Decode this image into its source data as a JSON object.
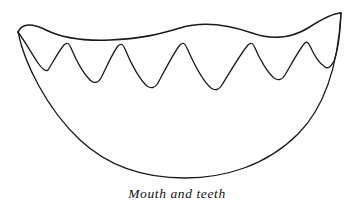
{
  "figure": {
    "title": "Mouth and teeth",
    "caption": "Mouth and teeth",
    "style": "black-and-white line art",
    "background_color": "#ffffff",
    "stroke_color": "#1a1a1a",
    "stroke_width": 1.3,
    "canvas": {
      "width": 354,
      "height": 208
    },
    "parts": [
      {
        "name": "upper-lip",
        "label": "Upper lip",
        "description": "wavy curve forming the top edge of the open mouth"
      },
      {
        "name": "teeth-row",
        "label": "Teeth",
        "description": "row of six pointed triangular teeth hanging from the upper lip",
        "tooth_count": 6
      },
      {
        "name": "lower-lip",
        "label": "Lower lip",
        "description": "deep U-shaped arc forming the bottom of the open mouth"
      }
    ],
    "geometry": {
      "left_corner": {
        "x": 18,
        "y": 32
      },
      "right_corner": {
        "x": 341,
        "y": 13
      },
      "lower_lip_bottom": {
        "x": 185,
        "y": 178
      },
      "upper_lip_path": "M18,32 C22,22 34,24 46,30 C62,38 86,41 110,40 C140,39 160,34 180,28 C206,20 232,26 252,33 C272,40 292,38 308,28 C322,19 334,13 341,13",
      "teeth_path": "M18,32 C24,40 32,54 38,63 C42,69 46,72 48,70 C52,64 58,52 64,45 C67,42 69,43 71,48 C76,60 84,74 90,80 C94,84 98,83 101,78 C107,66 113,52 118,46 C121,43 123,44 125,49 C131,64 140,80 147,86 C151,89 155,88 158,83 C165,70 174,52 180,45 C183,42 185,43 187,48 C194,64 204,82 211,88 C215,91 219,90 222,85 C230,72 241,53 248,45 C251,42 253,43 255,48 C260,60 268,73 274,78 C278,81 282,80 285,75 C292,63 299,50 304,44 C306,41 308,42 310,46 C314,55 320,64 325,67 C328,69 331,67 334,61 C337,53 340,38 341,13",
      "lower_lip_path": "M18,32 C24,62 46,108 80,140 C112,170 150,178 185,178 C224,178 266,166 298,134 C324,108 338,66 341,13",
      "tooth_peaks": [
        {
          "x": 64,
          "y": 45
        },
        {
          "x": 118,
          "y": 46
        },
        {
          "x": 180,
          "y": 45
        },
        {
          "x": 248,
          "y": 45
        },
        {
          "x": 304,
          "y": 44
        },
        {
          "x": 341,
          "y": 13
        }
      ],
      "tooth_valleys": [
        {
          "x": 48,
          "y": 70
        },
        {
          "x": 101,
          "y": 78
        },
        {
          "x": 158,
          "y": 83
        },
        {
          "x": 213,
          "y": 88
        },
        {
          "x": 285,
          "y": 75
        },
        {
          "x": 334,
          "y": 61
        }
      ]
    }
  }
}
